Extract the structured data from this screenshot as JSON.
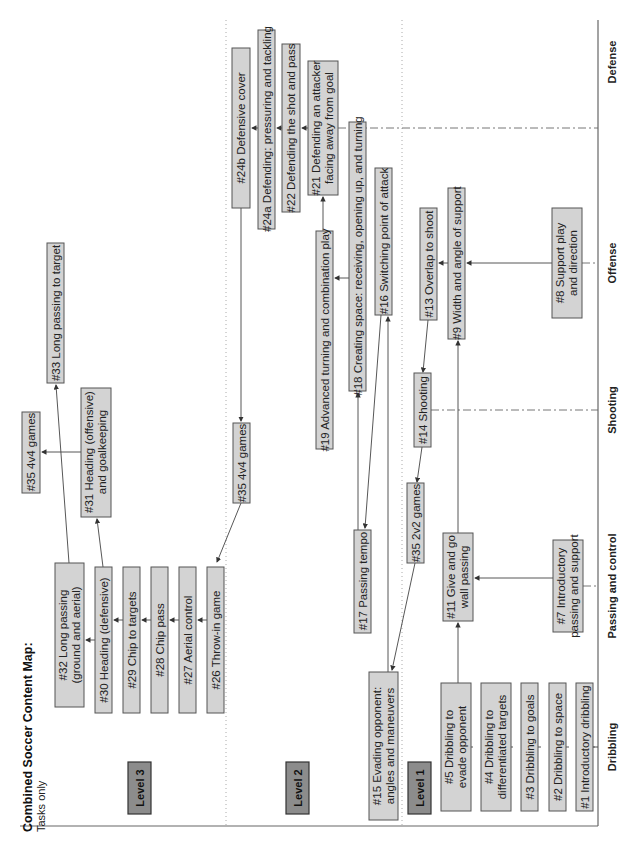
{
  "title": "Combined Soccer Content Map:",
  "subtitle": "Tasks only",
  "levels": [
    "Level 3",
    "Level 2",
    "Level 1"
  ],
  "categories": [
    "Dribbling",
    "Passing and control",
    "Shooting",
    "Offense",
    "Defense"
  ],
  "boxes": {
    "b33": "#33 Long passing to target",
    "b35a": "#35 4v4 games",
    "b31a": "#31 Heading (offensive)",
    "b31b": "and goalkeeping",
    "b32a": "#32 Long passing",
    "b32b": "(ground and aerial)",
    "b30": "#30 Heading (defensive)",
    "b29": "#29 Chip to targets",
    "b28": "#28 Chip pass",
    "b27": "#27 Aerial control",
    "b26": "#26 Throw-in game",
    "b24b": "#24b Defensive cover",
    "b24a": "#24a Defending: pressuring and tackling",
    "b22": "#22 Defending the shot and pass",
    "b21a": "#21 Defending an attacker",
    "b21b": "facing away from goal",
    "b19": "#19 Advanced turning and combination play",
    "b18": "#18 Creating space: receiving, opening up, and turning",
    "b16": "#16 Switching point of attack",
    "b35b": "#35 4v4 games",
    "b17": "#17 Passing tempo",
    "b15a": "#15 Evading opponent:",
    "b15b": "angles and maneuvers",
    "b13": "#13 Overlap to shoot",
    "b9": "#9 Width and angle of support",
    "b8a": "#8 Support play",
    "b8b": "and direction",
    "b14": "#14 Shooting",
    "b35c": "#35 2v2 games",
    "b11a": "#11 Give and go",
    "b11b": "wall passing",
    "b7a": "#7 Introductory",
    "b7b": "passing and support",
    "b5a": "#5 Dribbling to",
    "b5b": "evade opponent",
    "b4a": "#4 Dribbling to",
    "b4b": "differentiated targets",
    "b3": "#3 Dribbling to goals",
    "b2": "#2 Dribbling to space",
    "b1": "#1 Introductory dribbling"
  }
}
